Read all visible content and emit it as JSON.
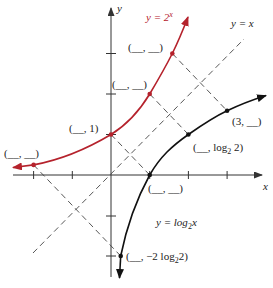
{
  "colors": {
    "exp_curve": "#b5222c",
    "log_curve": "#111111",
    "axes": "#333333",
    "dashed": "#444444"
  },
  "axes": {
    "x_label": "x",
    "y_label": "y",
    "origin_px": [
      111,
      175
    ],
    "unit_px_x": 38.7,
    "unit_px_y": 40.5
  },
  "labels": {
    "exp_curve": "y = 2",
    "exp_curve_sup": "x",
    "identity_line": "y = x",
    "log_curve_prefix": "y = log",
    "log_curve_sub": "2",
    "log_curve_suffix": "x"
  },
  "points": {
    "exp": [
      {
        "x": -2,
        "y": 0.25,
        "label": "(__, __)"
      },
      {
        "x": 0,
        "y": 1,
        "label": "(__, 1)"
      },
      {
        "x": 1,
        "y": 2,
        "label": "(__, __)"
      },
      {
        "x": 1.585,
        "y": 3,
        "label": "(__, __)"
      }
    ],
    "log": [
      {
        "x": 0.25,
        "y": -2,
        "label_prefix": "(__, −2 log",
        "label_sub": "2",
        "label_suffix": "2)"
      },
      {
        "x": 1,
        "y": 0,
        "label": "(__, __)"
      },
      {
        "x": 2,
        "y": 1,
        "label_prefix": "(__, log",
        "label_sub": "2",
        "label_suffix": " 2)"
      },
      {
        "x": 3,
        "y": 1.585,
        "label": "(3, __)"
      }
    ]
  }
}
